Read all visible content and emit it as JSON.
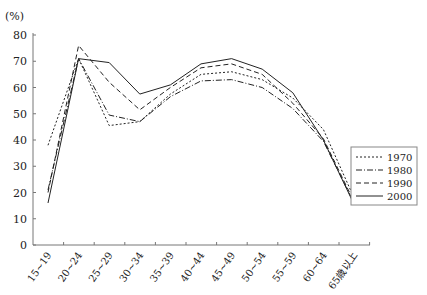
{
  "chart_data": {
    "type": "line",
    "title": "",
    "ylabel": "(%)",
    "xlabel": "",
    "ylim": [
      0,
      80
    ],
    "yticks": [
      0,
      10,
      20,
      30,
      40,
      50,
      60,
      70,
      80
    ],
    "grid": false,
    "legend_position": "right",
    "categories": [
      "15~19",
      "20~24",
      "25~29",
      "30~34",
      "35~39",
      "40~44",
      "45~49",
      "50~54",
      "55~59",
      "60~64",
      "65歳以上"
    ],
    "series": [
      {
        "name": "1970",
        "style": "dotted",
        "values": [
          38,
          71,
          45.5,
          47,
          57.5,
          65,
          66,
          63,
          56,
          44,
          18
        ]
      },
      {
        "name": "1980",
        "style": "dash-dot",
        "values": [
          21,
          71,
          49.5,
          47,
          56.5,
          62.5,
          63,
          60,
          52,
          39.5,
          16
        ]
      },
      {
        "name": "1990",
        "style": "dashed",
        "values": [
          20,
          76,
          62,
          51.5,
          60,
          67.5,
          69,
          65,
          54,
          40.5,
          16.5
        ]
      },
      {
        "name": "2000",
        "style": "solid",
        "values": [
          16,
          71,
          69.5,
          57.5,
          61,
          69,
          71,
          67,
          58,
          40,
          15.5
        ]
      }
    ]
  },
  "styles": {
    "dotted": "2,2",
    "dash-dot": "6,2,1,2",
    "dashed": "5,3",
    "solid": ""
  },
  "colors": {
    "line": "#222222",
    "axis": "#777777",
    "background": "#ffffff"
  }
}
